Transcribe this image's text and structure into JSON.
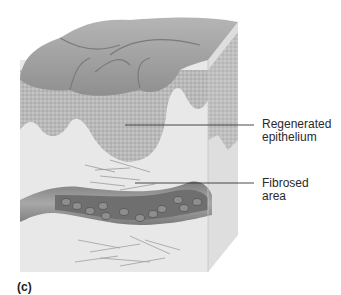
{
  "figure": {
    "panel_label": "(c)",
    "annotations": [
      {
        "id": "regenerated-epithelium",
        "line1": "Regenerated",
        "line2": "epithelium"
      },
      {
        "id": "fibrosed-area",
        "line1": "Fibrosed",
        "line2": "area"
      }
    ],
    "structures": [
      "skin-surface",
      "regenerated-epithelium-layer",
      "connective-tissue",
      "fibroblasts-scar-tissue",
      "blood-vessel",
      "red-blood-cells"
    ],
    "colors": {
      "surface": "#9a9a9a",
      "epithelium": "#b8b8b8",
      "dermis": "#e6e6e6",
      "vessel": "#8c8c8c",
      "vessel_lumen": "#6e6e6e",
      "leader_line": "#333333",
      "text": "#2a2a2a"
    }
  }
}
